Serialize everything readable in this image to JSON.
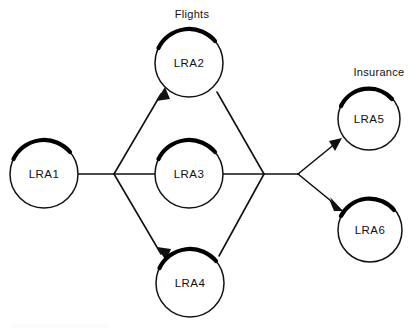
{
  "diagram": {
    "type": "flow-diagram",
    "title": "",
    "canvas": {
      "width": 417,
      "height": 332,
      "background": "#ffffff"
    },
    "stroke_color": "#111111",
    "shadow_color": "#000000",
    "node_fill": "#ffffff",
    "group_labels": [
      {
        "id": "flights",
        "text": "Flights",
        "x": 192,
        "y": 18
      },
      {
        "id": "insurance",
        "text": "Insurance",
        "x": 379,
        "y": 76
      }
    ],
    "nodes": [
      {
        "id": "lra1",
        "label": "LRA1",
        "cx": 44,
        "cy": 174,
        "r": 34
      },
      {
        "id": "lra2",
        "label": "LRA2",
        "cx": 189,
        "cy": 63,
        "r": 34
      },
      {
        "id": "lra3",
        "label": "LRA3",
        "cx": 189,
        "cy": 174,
        "r": 34
      },
      {
        "id": "lra4",
        "label": "LRA4",
        "cx": 190,
        "cy": 283,
        "r": 34
      },
      {
        "id": "lra5",
        "label": "LRA5",
        "cx": 369,
        "cy": 119,
        "r": 31
      },
      {
        "id": "lra6",
        "label": "LRA6",
        "cx": 370,
        "cy": 230,
        "r": 32
      }
    ],
    "junctions": [
      {
        "id": "fan-out-left",
        "x": 114,
        "y": 174
      },
      {
        "id": "fan-in-right",
        "x": 264,
        "y": 174
      },
      {
        "id": "fan-out-right",
        "x": 298,
        "y": 174
      }
    ],
    "edges": [
      {
        "id": "lra1-to-fanout",
        "from": "lra1",
        "to": "fan-out-left",
        "arrow": false
      },
      {
        "id": "fanout-to-lra2",
        "from": "fan-out-left",
        "to": "lra2",
        "arrow": true
      },
      {
        "id": "fanout-to-lra3",
        "from": "fan-out-left",
        "to": "lra3",
        "arrow": false
      },
      {
        "id": "fanout-to-lra4",
        "from": "fan-out-left",
        "to": "lra4",
        "arrow": true
      },
      {
        "id": "lra2-to-fanin",
        "from": "lra2",
        "to": "fan-in-right",
        "arrow": false
      },
      {
        "id": "lra3-to-fanin",
        "from": "lra3",
        "to": "fan-in-right",
        "arrow": false
      },
      {
        "id": "lra4-to-fanin",
        "from": "lra4",
        "to": "fan-in-right",
        "arrow": false
      },
      {
        "id": "fanin-to-fanout-right",
        "from": "fan-in-right",
        "to": "fan-out-right",
        "arrow": false
      },
      {
        "id": "fanoutright-to-lra5",
        "from": "fan-out-right",
        "to": "lra5",
        "arrow": true
      },
      {
        "id": "fanoutright-to-lra6",
        "from": "fan-out-right",
        "to": "lra6",
        "arrow": true
      }
    ]
  }
}
